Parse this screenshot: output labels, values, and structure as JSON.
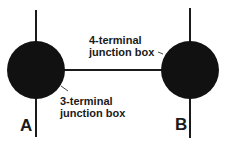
{
  "diagram": {
    "nodes": [
      {
        "id": "A",
        "label": "A",
        "callout": "3-terminal junction box",
        "callout_lines": [
          "3-terminal",
          "junction box"
        ]
      },
      {
        "id": "B",
        "label": "B",
        "callout": "4-terminal junction box",
        "callout_lines": [
          "4-terminal",
          "junction box"
        ]
      }
    ],
    "edges": [
      {
        "from": "A",
        "to": "B"
      }
    ],
    "colors": {
      "node": "#111111",
      "line": "#1a1a1a",
      "background": "#ffffff"
    }
  }
}
